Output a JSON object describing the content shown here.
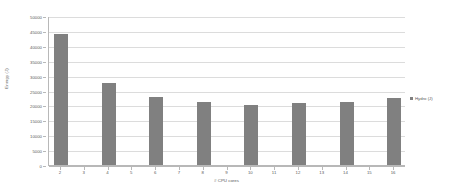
{
  "chart_data": {
    "type": "bar",
    "title": "",
    "xlabel": "# CPU cores",
    "ylabel": "Energy (J)",
    "categories": [
      "2",
      "3",
      "4",
      "5",
      "6",
      "7",
      "8",
      "9",
      "10",
      "11",
      "12",
      "13",
      "14",
      "15",
      "16"
    ],
    "series": [
      {
        "name": "Hydro (J)",
        "color": "#808080",
        "values": [
          44000,
          null,
          27500,
          null,
          22700,
          null,
          21000,
          null,
          20300,
          null,
          20800,
          null,
          21300,
          null,
          22500
        ]
      }
    ],
    "ylim": [
      0,
      50000
    ],
    "y_tick_labels": [
      "50000",
      "45000",
      "40000",
      "35000",
      "30000",
      "25000",
      "20000",
      "15000",
      "10000",
      "5000",
      "0"
    ],
    "y_tick_values": [
      50000,
      45000,
      40000,
      35000,
      30000,
      25000,
      20000,
      15000,
      10000,
      5000,
      0
    ],
    "grid": true,
    "legend_position": "right",
    "legend": [
      {
        "label": "Hydro (J)",
        "color": "#808080"
      }
    ]
  },
  "colors": {
    "bar": "#808080",
    "gridline": "#dcdcdc",
    "axis": "#b8b8b8",
    "text": "#595959",
    "background": "#ffffff"
  }
}
